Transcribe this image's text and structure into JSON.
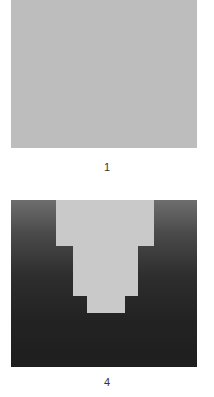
{
  "figures": [
    {
      "label": "1",
      "description": "uniform light gray square",
      "color": "#bdbdbd"
    },
    {
      "label": "4",
      "description": "dark gradient square with light gray stepped inverted-staircase shape",
      "background_top": "#6e6e6e",
      "background_bottom": "#1e1e1e",
      "shape_color": "#c9c9c9"
    }
  ]
}
